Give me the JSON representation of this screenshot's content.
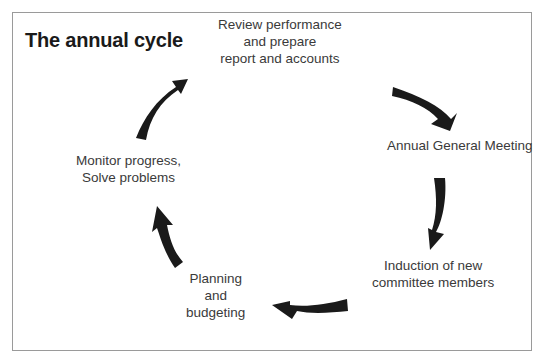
{
  "diagram": {
    "title": "The annual cycle",
    "type": "cycle",
    "nodes": [
      {
        "id": "review",
        "lines": [
          "Review performance",
          "and prepare",
          "report and accounts"
        ]
      },
      {
        "id": "agm",
        "lines": [
          "Annual General Meeting"
        ]
      },
      {
        "id": "induction",
        "lines": [
          "Induction of new",
          "committee members"
        ]
      },
      {
        "id": "planning",
        "lines": [
          "Planning",
          "and",
          "budgeting"
        ]
      },
      {
        "id": "monitor",
        "lines": [
          "Monitor progress,",
          "Solve problems"
        ]
      }
    ],
    "edges": [
      {
        "from": "review",
        "to": "agm"
      },
      {
        "from": "agm",
        "to": "induction"
      },
      {
        "from": "induction",
        "to": "planning"
      },
      {
        "from": "planning",
        "to": "monitor"
      },
      {
        "from": "monitor",
        "to": "review"
      }
    ],
    "arrow_color": "#1a1a1a"
  }
}
